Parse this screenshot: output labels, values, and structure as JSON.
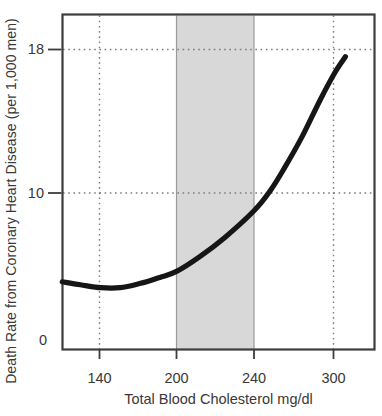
{
  "chart_data": {
    "type": "line",
    "title": "",
    "xlabel": "Total Blood Cholesterol mg/dl",
    "ylabel": "Death Rate from Coronary Heart Disease (per 1,000 men)",
    "x_ticks": [
      140,
      200,
      240,
      300
    ],
    "y_ticks": [
      0,
      10,
      18
    ],
    "xlim": [
      110,
      332
    ],
    "ylim": [
      0,
      20
    ],
    "grid": "dotted lines at y=10, y=18 and x=140, x=300",
    "legend": "none",
    "shaded_band_x": [
      200,
      240
    ],
    "series": [
      {
        "name": "CHD death rate per 1,000 men",
        "points": [
          [
            111,
            4.0
          ],
          [
            125,
            3.8
          ],
          [
            141,
            3.6
          ],
          [
            156,
            3.6
          ],
          [
            172,
            3.9
          ],
          [
            187,
            4.3
          ],
          [
            200,
            4.7
          ],
          [
            212,
            5.7
          ],
          [
            225,
            7.0
          ],
          [
            240,
            8.8
          ],
          [
            252,
            10.1
          ],
          [
            263,
            11.4
          ],
          [
            276,
            13.1
          ],
          [
            290,
            15.2
          ],
          [
            301,
            16.7
          ],
          [
            309,
            17.6
          ]
        ]
      }
    ],
    "colors": {
      "curve": "#161616",
      "band_fill": "#d8d8d8",
      "band_edge": "#9a9a9a",
      "grid": "#7d7d7d",
      "frame": "#3d3d3d",
      "text": "#383838",
      "background": "#ffffff"
    }
  }
}
